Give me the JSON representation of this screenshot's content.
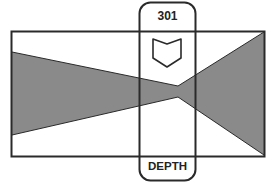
{
  "diagram": {
    "marker_number": "301",
    "marker_label": "DEPTH",
    "marker_icon": "shield-depth-icon",
    "colors": {
      "stroke": "#2a2a2a",
      "fill": "#8a8a8a",
      "background": "#ffffff"
    }
  }
}
